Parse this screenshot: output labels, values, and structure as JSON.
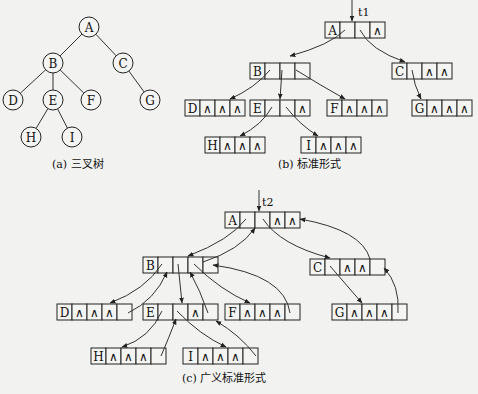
{
  "figure": {
    "tree": {
      "caption": "(a) 三叉树",
      "nodes": [
        {
          "id": "A",
          "children": [
            "B",
            "C"
          ]
        },
        {
          "id": "B",
          "children": [
            "D",
            "E",
            "F"
          ]
        },
        {
          "id": "C",
          "children": [
            "G"
          ]
        },
        {
          "id": "D",
          "children": []
        },
        {
          "id": "E",
          "children": [
            "H",
            "I"
          ]
        },
        {
          "id": "F",
          "children": []
        },
        {
          "id": "G",
          "children": []
        },
        {
          "id": "H",
          "children": []
        },
        {
          "id": "I",
          "children": []
        }
      ]
    },
    "standard": {
      "caption": "(b) 标准形式",
      "root_pointer": "t1",
      "null_symbol": "∧",
      "nodes": [
        {
          "id": "A",
          "fields": [
            "A",
            "ptr",
            "ptr",
            "∧"
          ]
        },
        {
          "id": "B",
          "fields": [
            "B",
            "ptr",
            "ptr",
            "ptr"
          ]
        },
        {
          "id": "C",
          "fields": [
            "C",
            "ptr",
            "∧",
            "∧"
          ]
        },
        {
          "id": "D",
          "fields": [
            "D",
            "∧",
            "∧",
            "∧"
          ]
        },
        {
          "id": "E",
          "fields": [
            "E",
            "ptr",
            "ptr",
            "∧"
          ]
        },
        {
          "id": "F",
          "fields": [
            "F",
            "∧",
            "∧",
            "∧"
          ]
        },
        {
          "id": "G",
          "fields": [
            "G",
            "∧",
            "∧",
            "∧"
          ]
        },
        {
          "id": "H",
          "fields": [
            "H",
            "∧",
            "∧",
            "∧"
          ]
        },
        {
          "id": "I",
          "fields": [
            "I",
            "∧",
            "∧",
            "∧"
          ]
        }
      ]
    },
    "generalized": {
      "caption": "(c) 广义标准形式",
      "root_pointer": "t2",
      "nodes": [
        {
          "id": "A",
          "fields": [
            "A",
            "ptr",
            "ptr",
            "∧",
            "∧"
          ]
        },
        {
          "id": "B",
          "fields": [
            "B",
            "ptr",
            "ptr",
            "ptr",
            "ptr"
          ]
        },
        {
          "id": "C",
          "fields": [
            "C",
            "ptr",
            "∧",
            "∧",
            "ptr"
          ]
        },
        {
          "id": "D",
          "fields": [
            "D",
            "∧",
            "∧",
            "∧",
            "ptr"
          ]
        },
        {
          "id": "E",
          "fields": [
            "E",
            "ptr",
            "ptr",
            "∧",
            "ptr"
          ]
        },
        {
          "id": "F",
          "fields": [
            "F",
            "∧",
            "∧",
            "∧",
            "ptr"
          ]
        },
        {
          "id": "G",
          "fields": [
            "G",
            "∧",
            "∧",
            "∧",
            "ptr"
          ]
        },
        {
          "id": "H",
          "fields": [
            "H",
            "∧",
            "∧",
            "∧",
            "ptr"
          ]
        },
        {
          "id": "I",
          "fields": [
            "I",
            "∧",
            "∧",
            "∧",
            "ptr"
          ]
        }
      ]
    }
  }
}
